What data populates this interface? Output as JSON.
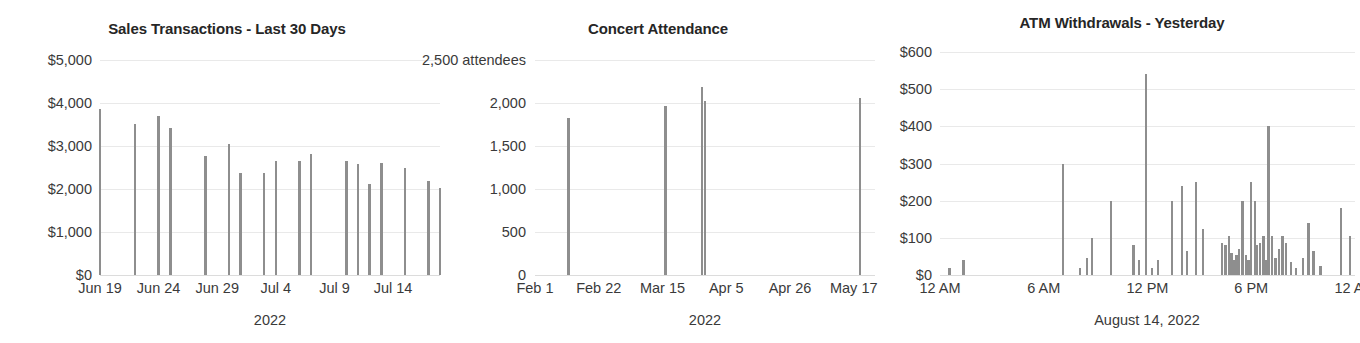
{
  "colors": {
    "bar": "#8e8e8e",
    "grid": "#e9e9e9",
    "text": "#3a3a3a",
    "title": "#262626",
    "background": "#ffffff"
  },
  "charts": [
    {
      "id": "sales-transactions",
      "title": "Sales Transactions - Last 30 Days",
      "xlabel": "2022",
      "ylabel": "",
      "type": "bar",
      "ylim": [
        0,
        5000
      ],
      "yticks": [
        0,
        1000,
        2000,
        3000,
        4000,
        5000
      ],
      "ytick_labels": [
        "$0",
        "$1,000",
        "$2,000",
        "$3,000",
        "$4,000",
        "$5,000"
      ],
      "xtick_labels": [
        "Jun 19",
        "Jun 24",
        "Jun 29",
        "Jul 4",
        "Jul 9",
        "Jul 14"
      ],
      "xlim_days": [
        0,
        29
      ],
      "xtick_days": [
        0,
        5,
        10,
        15,
        20,
        25
      ],
      "grid": true,
      "categories": [
        "Jun 19",
        "Jun 20",
        "Jun 21",
        "Jun 22",
        "Jun 23",
        "Jun 24",
        "Jun 25",
        "Jun 26",
        "Jun 27",
        "Jun 28",
        "Jun 29",
        "Jun 30",
        "Jul 1",
        "Jul 2",
        "Jul 3",
        "Jul 4",
        "Jul 5",
        "Jul 6",
        "Jul 7",
        "Jul 8",
        "Jul 9",
        "Jul 10",
        "Jul 11",
        "Jul 12",
        "Jul 13",
        "Jul 14",
        "Jul 15",
        "Jul 16",
        "Jul 17",
        "Jul 18"
      ],
      "values": [
        3850,
        0,
        0,
        3520,
        0,
        3700,
        3430,
        0,
        0,
        2760,
        0,
        3050,
        2370,
        0,
        2380,
        2660,
        0,
        2660,
        2810,
        0,
        0,
        2650,
        2590,
        2120,
        2600,
        0,
        2500,
        0,
        2180,
        2020
      ]
    },
    {
      "id": "concert-attendance",
      "title": "Concert Attendance",
      "xlabel": "2022",
      "ylabel": "attendees",
      "type": "bar",
      "ylim": [
        0,
        2500
      ],
      "yticks": [
        0,
        500,
        1000,
        1500,
        2000,
        2500
      ],
      "ytick_labels": [
        "0",
        "500",
        "1,000",
        "1,500",
        "2,000",
        "2,500 attendees"
      ],
      "xtick_labels": [
        "Feb 1",
        "Feb 22",
        "Mar 15",
        "Apr 5",
        "Apr 26",
        "May 17"
      ],
      "xlim_days": [
        0,
        112
      ],
      "xtick_days": [
        0,
        21,
        42,
        63,
        84,
        105
      ],
      "grid": true,
      "categories": [
        "Feb 12",
        "Mar 16",
        "Mar 28",
        "Mar 29",
        "May 19"
      ],
      "category_days": [
        11,
        43,
        55,
        56,
        107
      ],
      "values": [
        1830,
        1960,
        2190,
        2020,
        2060
      ]
    },
    {
      "id": "atm-withdrawals",
      "title": "ATM Withdrawals - Yesterday",
      "xlabel": "August 14, 2022",
      "ylabel": "",
      "type": "bar",
      "ylim": [
        0,
        600
      ],
      "yticks": [
        0,
        100,
        200,
        300,
        400,
        500,
        600
      ],
      "ytick_labels": [
        "$0",
        "$100",
        "$200",
        "$300",
        "$400",
        "$500",
        "$600"
      ],
      "xtick_labels": [
        "12 AM",
        "6 AM",
        "12 PM",
        "6 PM",
        "12 AM"
      ],
      "xlim_hours": [
        0,
        24
      ],
      "xtick_hours": [
        0,
        6,
        12,
        18,
        24
      ],
      "grid": true,
      "x_hours": [
        0.55,
        1.35,
        7.1,
        8.1,
        8.5,
        8.8,
        9.9,
        11.2,
        11.5,
        11.9,
        12.25,
        12.6,
        13.4,
        14.0,
        14.3,
        14.8,
        15.2,
        16.3,
        16.5,
        16.7,
        16.85,
        17.0,
        17.15,
        17.3,
        17.5,
        17.7,
        17.85,
        18.0,
        18.2,
        18.35,
        18.5,
        18.7,
        18.85,
        19.0,
        19.2,
        19.4,
        19.6,
        19.8,
        20.0,
        20.3,
        20.6,
        21.0,
        21.3,
        21.6,
        22.0,
        23.2,
        23.7
      ],
      "values": [
        20,
        40,
        300,
        20,
        45,
        100,
        200,
        80,
        40,
        540,
        20,
        40,
        200,
        240,
        65,
        250,
        125,
        85,
        80,
        105,
        60,
        40,
        55,
        70,
        200,
        55,
        40,
        250,
        200,
        80,
        85,
        105,
        40,
        400,
        105,
        45,
        70,
        105,
        85,
        35,
        20,
        45,
        140,
        65,
        25,
        180,
        105
      ]
    }
  ]
}
